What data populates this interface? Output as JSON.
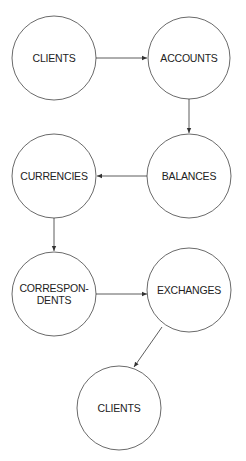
{
  "diagram": {
    "nodes": [
      {
        "id": "clients_top",
        "label": "CLIENTS",
        "cx": 54,
        "cy": 58,
        "r": 42
      },
      {
        "id": "accounts",
        "label": "ACCOUNTS",
        "cx": 189,
        "cy": 58,
        "r": 41
      },
      {
        "id": "balances",
        "label": "BALANCES",
        "cx": 189,
        "cy": 176,
        "r": 42
      },
      {
        "id": "currencies",
        "label": "CURRENCIES",
        "cx": 54,
        "cy": 176,
        "r": 42
      },
      {
        "id": "correspondents",
        "label": "CORRESPON-\nDENTS",
        "label_line1": "CORRESPON-",
        "label_line2": "DENTS",
        "cx": 54,
        "cy": 294,
        "r": 42
      },
      {
        "id": "exchanges",
        "label": "EXCHANGES",
        "cx": 189,
        "cy": 290,
        "r": 42
      },
      {
        "id": "clients_bottom",
        "label": "CLIENTS",
        "cx": 119,
        "cy": 408,
        "r": 42
      }
    ],
    "edges": [
      {
        "from": "clients_top",
        "to": "accounts"
      },
      {
        "from": "accounts",
        "to": "balances"
      },
      {
        "from": "balances",
        "to": "currencies"
      },
      {
        "from": "currencies",
        "to": "correspondents"
      },
      {
        "from": "correspondents",
        "to": "exchanges"
      },
      {
        "from": "exchanges",
        "to": "clients_bottom"
      }
    ],
    "colors": {
      "stroke": "#333333",
      "text": "#222222",
      "background": "#ffffff"
    }
  }
}
